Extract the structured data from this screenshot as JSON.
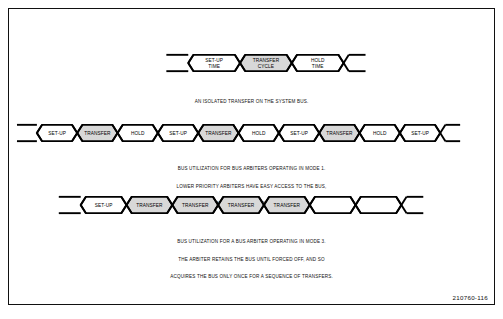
{
  "figure": {
    "number": "210760-116",
    "colors": {
      "line": "#000000",
      "transfer_fill": "#d8d8d8",
      "cell_fill": "#ffffff",
      "border": "#111111",
      "background": "#ffffff"
    }
  },
  "diagrams": [
    {
      "id": "isolated-transfer",
      "cells": [
        {
          "label_line1": "SET-UP",
          "label_line2": "TIME",
          "shaded": false
        },
        {
          "label_line1": "TRANSFER",
          "label_line2": "CYCLE",
          "shaded": true
        },
        {
          "label_line1": "HOLD",
          "label_line2": "TIME",
          "shaded": false
        }
      ],
      "caption": [
        "AN ISOLATED TRANSFER ON THE SYSTEM BUS."
      ]
    },
    {
      "id": "mode-1-utilization",
      "cells": [
        {
          "label_line1": "SET-UP",
          "label_line2": "",
          "shaded": false
        },
        {
          "label_line1": "TRANSFER",
          "label_line2": "",
          "shaded": true
        },
        {
          "label_line1": "HOLD",
          "label_line2": "",
          "shaded": false
        },
        {
          "label_line1": "SET-UP",
          "label_line2": "",
          "shaded": false
        },
        {
          "label_line1": "TRANSFER",
          "label_line2": "",
          "shaded": true
        },
        {
          "label_line1": "HOLD",
          "label_line2": "",
          "shaded": false
        },
        {
          "label_line1": "SET-UP",
          "label_line2": "",
          "shaded": false
        },
        {
          "label_line1": "TRANSFER",
          "label_line2": "",
          "shaded": true
        },
        {
          "label_line1": "HOLD",
          "label_line2": "",
          "shaded": false
        },
        {
          "label_line1": "SET-UP",
          "label_line2": "",
          "shaded": false
        }
      ],
      "caption": [
        "BUS UTILIZATION FOR BUS ARBITERS OPERATING IN MODE 1.",
        "LOWER PRIORITY ARBITERS HAVE EASY ACCESS TO THE BUS,",
        "BUT BUS EFFICIENCY IS LOW."
      ]
    },
    {
      "id": "mode-3-utilization",
      "cells": [
        {
          "label_line1": "SET-UP",
          "label_line2": "",
          "shaded": false
        },
        {
          "label_line1": "TRANSFER",
          "label_line2": "",
          "shaded": true
        },
        {
          "label_line1": "TRANSFER",
          "label_line2": "",
          "shaded": true
        },
        {
          "label_line1": "TRANSFER",
          "label_line2": "",
          "shaded": true
        },
        {
          "label_line1": "TRANSFER",
          "label_line2": "",
          "shaded": true
        },
        {
          "label_line1": "",
          "label_line2": "",
          "shaded": false
        },
        {
          "label_line1": "",
          "label_line2": "",
          "shaded": false
        }
      ],
      "caption": [
        "BUS UTILIZATION FOR A BUS ARBITER OPERATING IN MODE 3.",
        "THE ARBITER RETAINS THE BUS UNTIL FORCED OFF, AND SO",
        "ACQUIRES THE BUS ONLY ONCE FOR A SEQUENCE OF TRANSFERS."
      ]
    }
  ]
}
